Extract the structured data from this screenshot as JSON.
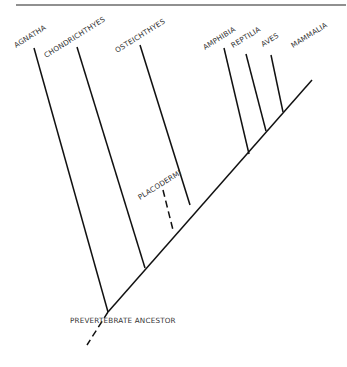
{
  "diagram": {
    "type": "cladogram",
    "root_label": "PREVERTEBRATE ANCESTOR",
    "taxa": [
      {
        "name": "AGNATHA"
      },
      {
        "name": "CHONDRICHTHYES"
      },
      {
        "name": "PLACODERMI",
        "extinct_dashed": true
      },
      {
        "name": "OSTEICHTHYES"
      },
      {
        "name": "AMPHIBIA"
      },
      {
        "name": "REPTILIA"
      },
      {
        "name": "AVES"
      },
      {
        "name": "MAMMALIA"
      }
    ],
    "colors": {
      "line": "#111111",
      "text": "#333333",
      "rule": "#222222"
    }
  }
}
